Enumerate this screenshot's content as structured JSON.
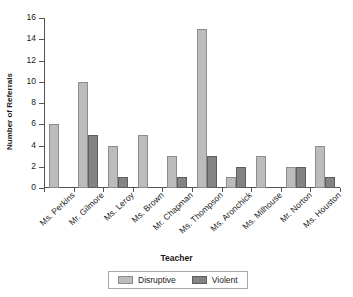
{
  "chart_data": {
    "type": "bar",
    "title": "",
    "xlabel": "Teacher",
    "ylabel": "Number of Referrals",
    "ylim": [
      0,
      16
    ],
    "yticks": [
      0,
      2,
      4,
      6,
      8,
      10,
      12,
      14,
      16
    ],
    "grid": false,
    "legend_position": "bottom-center",
    "categories": [
      "Ms. Perkins",
      "Mr. Gilmore",
      "Ms. Leroy",
      "Ms. Brown",
      "Mr. Chapman",
      "Ms. Thompson",
      "Ms. Aronchick",
      "Ms. Milhouse",
      "Mr. Norton",
      "Ms. Houston"
    ],
    "series": [
      {
        "name": "Disruptive",
        "color": "#bcbcbc",
        "values": [
          6,
          10,
          4,
          5,
          3,
          15,
          1,
          3,
          2,
          4
        ]
      },
      {
        "name": "Violent",
        "color": "#838383",
        "values": [
          0,
          5,
          1,
          0,
          1,
          3,
          2,
          0,
          2,
          1
        ]
      }
    ]
  }
}
